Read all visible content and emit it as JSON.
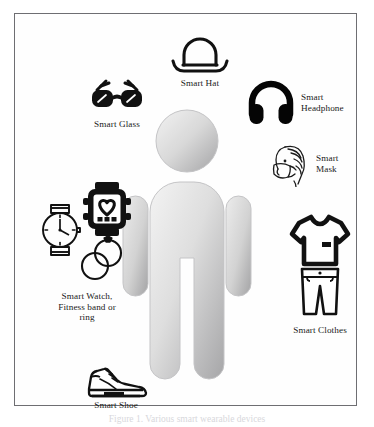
{
  "figure": {
    "caption": "Figure 1. Various smart wearable devices",
    "border_color": "#6e6e72",
    "background": "#fefefe"
  },
  "human": {
    "name": "human-body-pictogram",
    "fill_light": "#efefef",
    "fill_dark": "#a9a9ab",
    "outline": "#c9c9cb"
  },
  "nodes": [
    {
      "id": "hat",
      "icon": "smart-hat-icon",
      "label": "Smart Hat",
      "color": "#111111"
    },
    {
      "id": "glass",
      "icon": "smart-glasses-icon",
      "label": "Smart Glass",
      "color": "#111111"
    },
    {
      "id": "headphone",
      "icon": "smart-headphone-icon",
      "label": "Smart\nHeadphone",
      "color": "#050505"
    },
    {
      "id": "mask",
      "icon": "smart-mask-icon",
      "label": "Smart\nMask",
      "color": "#1b1b1b"
    },
    {
      "id": "watch",
      "icon": "smart-watch-fitness-ring-icon",
      "label": "Smart Watch,\nFitness band or\nring",
      "color": "#111111"
    },
    {
      "id": "clothes",
      "icon": "smart-clothes-icon",
      "label": "Smart Clothes",
      "color": "#111111"
    },
    {
      "id": "shoe",
      "icon": "smart-shoe-icon",
      "label": "Smart Shoe",
      "color": "#111111"
    }
  ]
}
